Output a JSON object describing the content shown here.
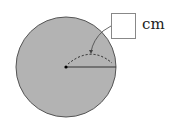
{
  "diagram": {
    "answer_box": {
      "value": ""
    },
    "unit_label": "cm",
    "circle": {
      "fill": "#b3b3b3",
      "stroke": "#555555"
    },
    "elements": [
      "center-point",
      "radius-line",
      "dashed-arc",
      "callout-arrow"
    ]
  }
}
